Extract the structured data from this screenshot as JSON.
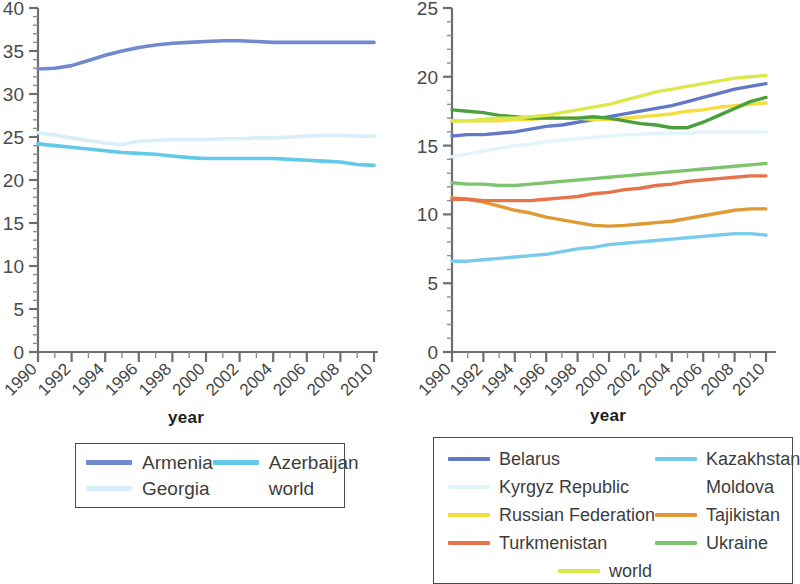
{
  "figure": {
    "left_panel": {
      "xlabel": "year",
      "ylabel": "",
      "yticks": [
        "0",
        "5",
        "10",
        "15",
        "20",
        "25",
        "30",
        "35",
        "40"
      ],
      "xticks": [
        "1990",
        "1992",
        "1994",
        "1996",
        "1998",
        "2000",
        "2002",
        "2004",
        "2006",
        "2008",
        "2010"
      ]
    },
    "right_panel": {
      "xlabel": "year",
      "ylabel": "",
      "yticks": [
        "0",
        "5",
        "10",
        "15",
        "20",
        "25"
      ],
      "xticks": [
        "1990",
        "1992",
        "1994",
        "1996",
        "1998",
        "2000",
        "2002",
        "2004",
        "2006",
        "2008",
        "2010"
      ]
    }
  },
  "legend_left": {
    "items": [
      {
        "label": "Armenia",
        "color": "#7189cf"
      },
      {
        "label": "Azerbaijan",
        "color": "#62c9e8"
      },
      {
        "label": "Georgia",
        "color": "#d8eefa"
      },
      {
        "label": "world",
        "color": "#fdfdfd"
      }
    ]
  },
  "legend_right": {
    "items": [
      {
        "label": "Belarus",
        "color": "#6379c8"
      },
      {
        "label": "Kazakhstan",
        "color": "#79cbeb"
      },
      {
        "label": "Kyrgyz Republic",
        "color": "#e2f4fb"
      },
      {
        "label": "Moldova",
        "color": "#fdfdfd"
      },
      {
        "label": "Russian Federation",
        "color": "#f4de3c"
      },
      {
        "label": "Tajikistan",
        "color": "#e09a35"
      },
      {
        "label": "Turkmenistan",
        "color": "#e8724a"
      },
      {
        "label": "Ukraine",
        "color": "#7ec46e"
      },
      {
        "label": "world",
        "color": "#dce84a"
      }
    ]
  },
  "chart_data": [
    {
      "type": "line",
      "title": "",
      "xlabel": "year",
      "ylabel": "",
      "xlim": [
        1990,
        2010
      ],
      "ylim": [
        0,
        40
      ],
      "yticks": [
        0,
        5,
        10,
        15,
        20,
        25,
        30,
        35,
        40
      ],
      "grid": false,
      "legend_position": "below-center",
      "x": [
        1990,
        1991,
        1992,
        1993,
        1994,
        1995,
        1996,
        1997,
        1998,
        1999,
        2000,
        2001,
        2002,
        2003,
        2004,
        2005,
        2006,
        2007,
        2008,
        2009,
        2010
      ],
      "series": [
        {
          "name": "Armenia",
          "color": "#7189cf",
          "values": [
            32.9,
            33.0,
            33.3,
            33.9,
            34.5,
            35.0,
            35.4,
            35.7,
            35.9,
            36.0,
            36.1,
            36.2,
            36.2,
            36.1,
            36.0,
            36.0,
            36.0,
            36.0,
            36.0,
            36.0,
            36.0
          ]
        },
        {
          "name": "Azerbaijan",
          "color": "#62c9e8",
          "values": [
            24.2,
            24.0,
            23.8,
            23.6,
            23.4,
            23.2,
            23.1,
            23.0,
            22.8,
            22.6,
            22.5,
            22.5,
            22.5,
            22.5,
            22.5,
            22.4,
            22.3,
            22.2,
            22.1,
            21.8,
            21.7
          ]
        },
        {
          "name": "Georgia",
          "color": "#d8eefa",
          "values": [
            25.5,
            25.2,
            24.9,
            24.6,
            24.3,
            24.1,
            24.5,
            24.6,
            24.7,
            24.7,
            24.7,
            24.8,
            24.8,
            24.9,
            24.9,
            25.0,
            25.1,
            25.2,
            25.2,
            25.1,
            25.1
          ]
        },
        {
          "name": "world",
          "color": "#fdfdfd",
          "values": [
            null,
            null,
            null,
            null,
            null,
            null,
            null,
            null,
            null,
            null,
            null,
            null,
            null,
            null,
            null,
            null,
            null,
            null,
            null,
            null,
            null
          ]
        }
      ]
    },
    {
      "type": "line",
      "title": "",
      "xlabel": "year",
      "ylabel": "",
      "xlim": [
        1990,
        2010
      ],
      "ylim": [
        0,
        25
      ],
      "yticks": [
        0,
        5,
        10,
        15,
        20,
        25
      ],
      "grid": false,
      "legend_position": "below-center",
      "x": [
        1990,
        1991,
        1992,
        1993,
        1994,
        1995,
        1996,
        1997,
        1998,
        1999,
        2000,
        2001,
        2002,
        2003,
        2004,
        2005,
        2006,
        2007,
        2008,
        2009,
        2010
      ],
      "series": [
        {
          "name": "Belarus",
          "color": "#6379c8",
          "values": [
            15.7,
            15.8,
            15.8,
            15.9,
            16.0,
            16.2,
            16.4,
            16.5,
            16.7,
            16.9,
            17.1,
            17.3,
            17.5,
            17.7,
            17.9,
            18.2,
            18.5,
            18.8,
            19.1,
            19.3,
            19.5
          ]
        },
        {
          "name": "Kazakhstan",
          "color": "#79cbeb",
          "values": [
            6.6,
            6.6,
            6.7,
            6.8,
            6.9,
            7.0,
            7.1,
            7.3,
            7.5,
            7.6,
            7.8,
            7.9,
            8.0,
            8.1,
            8.2,
            8.3,
            8.4,
            8.5,
            8.6,
            8.6,
            8.5
          ]
        },
        {
          "name": "Kyrgyz Republic",
          "color": "#e2f4fb",
          "values": [
            14.2,
            14.4,
            14.6,
            14.8,
            15.0,
            15.1,
            15.3,
            15.4,
            15.5,
            15.6,
            15.7,
            15.8,
            15.8,
            15.9,
            15.9,
            15.9,
            16.0,
            16.0,
            16.0,
            16.0,
            16.0
          ]
        },
        {
          "name": "Moldova",
          "color": "#fdfdfd",
          "values": [
            null,
            null,
            null,
            null,
            null,
            null,
            null,
            null,
            null,
            null,
            null,
            null,
            null,
            null,
            null,
            null,
            null,
            null,
            null,
            null,
            null
          ]
        },
        {
          "name": "Russian Federation",
          "color": "#f4de3c",
          "values": [
            16.8,
            16.8,
            16.8,
            16.8,
            16.9,
            16.9,
            17.0,
            17.0,
            17.0,
            16.9,
            16.9,
            17.0,
            17.1,
            17.2,
            17.3,
            17.5,
            17.6,
            17.8,
            17.9,
            18.0,
            18.1
          ]
        },
        {
          "name": "Tajikistan",
          "color": "#e09a35",
          "values": [
            11.2,
            11.1,
            10.9,
            10.6,
            10.3,
            10.1,
            9.8,
            9.6,
            9.4,
            9.2,
            9.15,
            9.2,
            9.3,
            9.4,
            9.5,
            9.7,
            9.9,
            10.1,
            10.3,
            10.4,
            10.4
          ]
        },
        {
          "name": "Turkmenistan",
          "color": "#e8724a",
          "values": [
            11.1,
            11.1,
            11.0,
            11.0,
            11.0,
            11.0,
            11.1,
            11.2,
            11.3,
            11.5,
            11.6,
            11.8,
            11.9,
            12.1,
            12.2,
            12.4,
            12.5,
            12.6,
            12.7,
            12.8,
            12.8
          ]
        },
        {
          "name": "Ukraine",
          "color": "#7ec46e",
          "values": [
            12.3,
            12.2,
            12.2,
            12.1,
            12.1,
            12.2,
            12.3,
            12.4,
            12.5,
            12.6,
            12.7,
            12.8,
            12.9,
            13.0,
            13.1,
            13.2,
            13.3,
            13.4,
            13.5,
            13.6,
            13.7
          ]
        },
        {
          "name": "Ukraine (total pop. share)",
          "color": "#4aa03c",
          "values": [
            17.6,
            17.5,
            17.4,
            17.2,
            17.1,
            17.0,
            17.0,
            17.0,
            17.0,
            17.1,
            17.0,
            16.8,
            16.6,
            16.5,
            16.3,
            16.3,
            16.7,
            17.2,
            17.7,
            18.2,
            18.5
          ]
        },
        {
          "name": "world",
          "color": "#dce84a",
          "values": [
            16.8,
            16.8,
            16.9,
            17.0,
            17.0,
            17.1,
            17.2,
            17.4,
            17.6,
            17.8,
            18.0,
            18.3,
            18.6,
            18.9,
            19.1,
            19.3,
            19.5,
            19.7,
            19.9,
            20.0,
            20.1
          ]
        }
      ]
    }
  ]
}
